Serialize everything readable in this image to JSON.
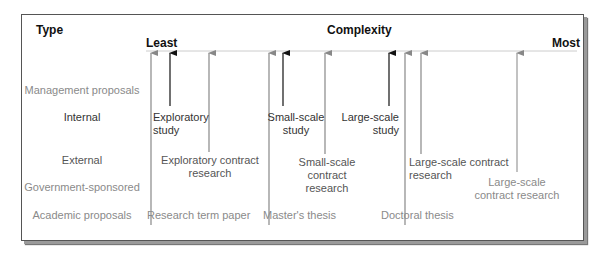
{
  "diagram": {
    "header": {
      "type_label": "Type",
      "complexity_label": "Complexity",
      "least_label": "Least",
      "most_label": "Most"
    },
    "row_labels": [
      {
        "text": "Management proposals",
        "shade": "light"
      },
      {
        "text": "Internal",
        "shade": "dark"
      },
      {
        "text": "External",
        "shade": "mid"
      },
      {
        "text": "Government-sponsored",
        "shade": "light"
      },
      {
        "text": "Academic proposals",
        "shade": "light"
      }
    ],
    "items": [
      {
        "line1": "Exploratory",
        "line2": "study",
        "row": "Internal",
        "arrow_color": "#111111"
      },
      {
        "line1": "Small-scale",
        "line2": "study",
        "row": "Internal",
        "arrow_color": "#111111"
      },
      {
        "line1": "Large-scale",
        "line2": "study",
        "row": "Internal",
        "arrow_color": "#111111"
      },
      {
        "line1": "Exploratory contract",
        "line2": "research",
        "row": "External",
        "arrow_color": "#888888"
      },
      {
        "line1": "Small-scale",
        "line2": "contract",
        "line3": "research",
        "row": "External",
        "arrow_color": "#888888"
      },
      {
        "line1": "Large-scale contract",
        "line2": "research",
        "row": "External",
        "arrow_color": "#888888"
      },
      {
        "line1": "Large-scale",
        "line2": "contract research",
        "row": "Government-sponsored",
        "arrow_color": "#999999"
      },
      {
        "line1": "Research term paper",
        "row": "Academic proposals",
        "arrow_color": "#888888"
      },
      {
        "line1": "Master's thesis",
        "row": "Academic proposals",
        "arrow_color": "#888888"
      },
      {
        "line1": "Doctoral thesis",
        "row": "Academic proposals",
        "arrow_color": "#888888"
      }
    ],
    "colors": {
      "axis_line": "#cccccc",
      "black_arrow": "#111111",
      "gray_arrow": "#888888"
    }
  }
}
